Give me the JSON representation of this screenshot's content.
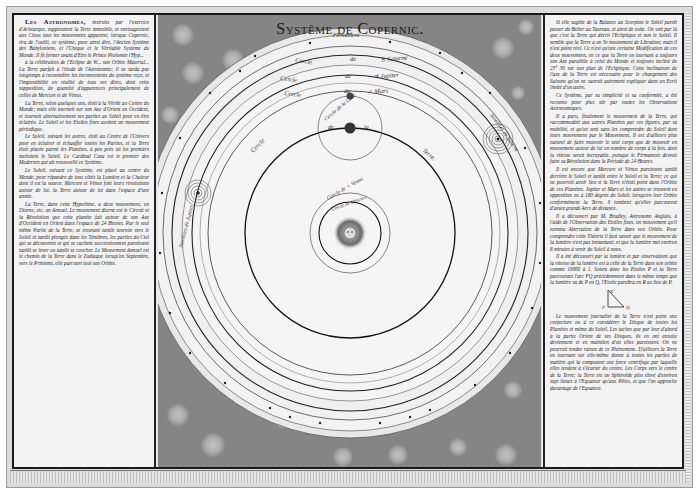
{
  "title": "Systême de Copernic.",
  "diagram": {
    "firmament_label": "Firmament",
    "orbit_labels": {
      "saturn": "Cercle de ♄ Saturne",
      "jupiter": "Cercle de ♃ Jupiter",
      "mars": "Cercle de ♂ Mars",
      "moon": "Cercle de la Lune",
      "earth_left": "Cercle",
      "earth_mid1": "de",
      "earth_mid2": "la",
      "earth_right": "Terre",
      "venus": "Cercle de ♀ Venus",
      "mercury": "Cercle de Mercure",
      "jupiter_satellites": "Satellites de Jupiter",
      "saturn_satellites": "Satellites de Saturne"
    },
    "center_body": "Sun",
    "colors": {
      "background_mottled": "#858585",
      "disc": "#f1f1f1",
      "ink": "#1a1a1a"
    }
  },
  "left_text": {
    "lead": "Les Astronomes,",
    "paragraphs": [
      "instruits par l'exercice d'Aristarque, supposoient la Terre immobile, et envisageoient aux Cieux tous les mouvemens apparens; lorsque Copernic, tira de l'oubli, ce système, pour ainsi dire, l'Ancien Système des Babyloniens, et l'Unique et le Véritable Système du Monde. Il fit fermer avant d'Etre le Prince Ptolomée l'Hyp...",
      "à la célébration de l'Eclipse de W... son Orbite Material... La Terre parfait à l'étude de l'Astronomie; il ne tarda pas longtemps à reconnoître les inconvenients du système reçu, et l'impossibilité en réalité de tous ses dires, dont cette supposition, de quantité d'apparences principalement de celles de Mercure et de Vénus.",
      "La Terre, selon quelques uns, étoit à la Vérité au Centre du Monde; mais elle tournoit sur son Axe d'Orient en Occident, et tournoit alternativement ses parties au Soleil pour en être éclairée. Le Soleil et les Etoiles fixes avoient un mouvement périodique.",
      "Le Soleil, suivant les autres, étoit au Centre de l'Univers pour en éclairer et échauffer toutes les Parties, et la Terre étoit placée parmi les Planètes, à peu près où les premiers mettoient le Soleil. Le Cardinal Cusa est le premier des Modernes qui ait renouvellé ce Système.",
      "Le Soleil, suivant ce Système, est placé au centre du Monde, pour répandre de tous côtés la Lumière et la Chaleur dont il est la source. Mercure et Vénus font leurs révolutions autour de lui, la Terre autour de lui dans l'espace d'une année.",
      "La Terre, dans cette Hypothèse, a deux mouvemens, un Diurne, etc. un Annuel. Le mouvement diurne est le Circuit et la Révolution que cette planète fait autour de son Axe d'Occident en Orient dans l'espace de 24 Heures. Par le seul même Partie de la Terre, se trouvant tantôt tournée vers le Soleil et tantôt plongée dans les Ténèbres, les parties du Ciel qui se découvrent et qui se cachent successivement paroissent tantôt se lever ou tantôt se coucher. Le Mouvement Annuel est le chemin de la Terre dans le Zodiaque lorsqu'en Septembre, vers le Printems, elle parcourt tout son Orbite."
    ]
  },
  "right_text": {
    "paragraphs": [
      "Si elle sagitte de la Balance au Scorpion le Soleil paroît passer du Belier au Taureau, et ainsi de suite. On voit par là que c'est la Terre qui décrit l'Ecliptique et non le Soleil. Il semble que la Terre a un 3e mouvement de Libration; mais il n'est point réel. Ce n'est qu'une certaine Modification de ces deux mouvemens, en ce que la Terre en tournant a toujours son Axe parallèle à celui du Monde et toujours incliné de 23° 30 sur son plan de l'Ecliptique. Cette inclinaison de l'axe de la Terre est nécessaire pour le changement des Saisons qu'on ne sauroit autrement expliquer dans un Ecrit limité d'un autre.",
      "Ce Système, par sa simplicité et sa conformité, a été reconnu pour plus sûr par toutes les Observations Astronomiques.",
      "Il a paru, finalement le mouvement de la Terre, qui raccommodoit aux autres Planètes par ces figures, par sa mobilité, et qu'on sent sans les comprendre du Soleil dont leurs mouvemens par le Mouvement. Il est d'ailleurs plus naturel de faire mouvoir le seul corps que de mouvoir en mouvement autour de lui un nombre de corps à la fois, dont la vitesse seroit incroyable, puisque le Firmament devroit faire sa Révolution dans la Période de 24 Heures.",
      "Il est encore que Mercure et Vénus paroissent tantôt derrière le Soleil et tantôt entre le Soleil et la Terre; ce qui ne pourroit avoir lieu si la Terre n'étoit point dans l'Orbite de ces Planètes. Jupiter et Mars et les autres se trouvent en opposition ou à 180 degrés du Soleil, lorsqu'en leur Orbite conformément la Terre, il tombent qu'elles parcourent d'assez grands Arcs de distance.",
      "Il a découvert par M. Bradley, Astronome Anglais, à l'aide de l'Observation des Etoiles fixes, un mouvement qu'il nomma Aberration de la Terre dans son Orbite. Pour comprendre cette Théorie il faut savoir que le mouvement de la lumière n'est pas instantané, et que la lumière met environ 8 minutes à venir du Soleil à nous.",
      "Il a été découvert par la lumière et par observations que la vitesse de la lumière est à celle de la Terre dans son orbite comme 10000 à 1. Soient donc les Etoiles P et la Terre parcourant l'arc FQ précédemment dans le même temps que la lumière va de P en Q, l'Etoile paroîtra en R au lieu de P.",
      "Le mouvement journalier de la Terre n'est point une conjecture ou à ce considérer le Disque de toutes les Planètes et même du Soleil. Les taches que par leur d'abord à la partie Orient de ses Disques, ils en ont ensuite deviennent et en maintien d'où elles paroissent. On ne pourroit rendre raison de ce Phénomène. D'ailleurs la Terre en tournant sur elle-même donne à toutes les parties de matière qui la composent une force centrifuge par laquelle elles tendent à s'écarter du centre. Les Corps vers le centre de la Terre; la Terre est un Sphéroïde plus élevé d'environ sept lieues à l'Equateur qu'aux Pôles, et que l'on approche davantage de l'Equateur."
    ],
    "figure_labels": [
      "R",
      "F",
      "Q",
      "P"
    ]
  }
}
